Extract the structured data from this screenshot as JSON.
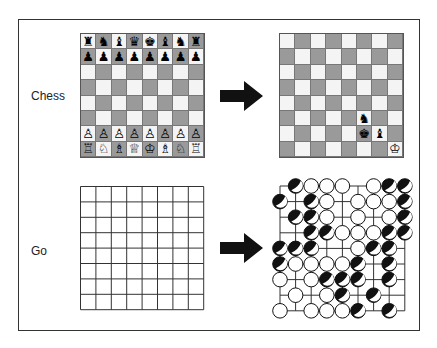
{
  "labels": {
    "chess": "Chess",
    "go": "Go"
  },
  "colors": {
    "light_square": "#f4f4f4",
    "dark_square": "#9a9a9a",
    "frame": "#333333",
    "arrow": "#111111"
  },
  "chess_start": [
    [
      "♜",
      "♞",
      "♝",
      "♛",
      "♚",
      "♝",
      "♞",
      "♜"
    ],
    [
      "♟",
      "♟",
      "♟",
      "♟",
      "♟",
      "♟",
      "♟",
      "♟"
    ],
    [
      "",
      "",
      "",
      "",
      "",
      "",
      "",
      ""
    ],
    [
      "",
      "",
      "",
      "",
      "",
      "",
      "",
      ""
    ],
    [
      "",
      "",
      "",
      "",
      "",
      "",
      "",
      ""
    ],
    [
      "",
      "",
      "",
      "",
      "",
      "",
      "",
      ""
    ],
    [
      "♙",
      "♙",
      "♙",
      "♙",
      "♙",
      "♙",
      "♙",
      "♙"
    ],
    [
      "♖",
      "♘",
      "♗",
      "♕",
      "♔",
      "♗",
      "♘",
      "♖"
    ]
  ],
  "chess_end": [
    [
      "",
      "",
      "",
      "",
      "",
      "",
      "",
      ""
    ],
    [
      "",
      "",
      "",
      "",
      "",
      "",
      "",
      ""
    ],
    [
      "",
      "",
      "",
      "",
      "",
      "",
      "",
      ""
    ],
    [
      "",
      "",
      "",
      "",
      "",
      "",
      "",
      ""
    ],
    [
      "",
      "",
      "",
      "",
      "",
      "",
      "",
      ""
    ],
    [
      "",
      "",
      "",
      "",
      "",
      "♞",
      "",
      ""
    ],
    [
      "",
      "",
      "",
      "",
      "",
      "♚",
      "♝",
      ""
    ],
    [
      "",
      "",
      "",
      "",
      "",
      "",
      "",
      "♔"
    ]
  ],
  "go_end": [
    "_BWWW_WBB",
    "B_BW_WWWB",
    "_BBW_W_WB",
    "__BBWWWBB",
    "BBB__WBB_",
    "BWWWWB_B_",
    "W_WBBB_B_",
    "_W_WB_B__",
    "W_WWWB_B_"
  ]
}
